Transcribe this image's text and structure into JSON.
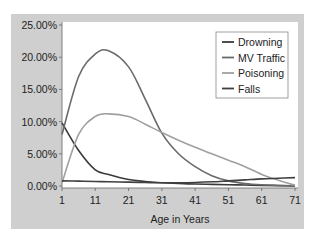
{
  "chart_data": {
    "type": "line",
    "title": "",
    "xlabel": "Age in Years",
    "ylabel": "",
    "x_ticks": [
      "1",
      "11",
      "21",
      "31",
      "41",
      "51",
      "61",
      "71"
    ],
    "y_ticks": [
      "0.00%",
      "5.00%",
      "10.00%",
      "15.00%",
      "20.00%",
      "25.00%"
    ],
    "xlim": [
      1,
      71
    ],
    "ylim": [
      0,
      25
    ],
    "grid": false,
    "legend_position": "upper right",
    "x": [
      1,
      6,
      11,
      15,
      21,
      26,
      31,
      36,
      41,
      46,
      51,
      56,
      61,
      66,
      71
    ],
    "series": [
      {
        "name": "Drowning",
        "color": "#3a3a3a",
        "values": [
          9.8,
          5.5,
          2.5,
          1.8,
          1.0,
          0.7,
          0.5,
          0.4,
          0.3,
          0.25,
          0.2,
          0.15,
          0.1,
          0.05,
          0.0
        ]
      },
      {
        "name": "MV Traffic",
        "color": "#6a6a6a",
        "values": [
          8.0,
          17.0,
          20.5,
          21.0,
          18.5,
          13.5,
          8.2,
          5.0,
          3.0,
          1.6,
          0.8,
          0.4,
          0.2,
          0.1,
          0.0
        ]
      },
      {
        "name": "Poisoning",
        "color": "#a0a0a0",
        "values": [
          0.5,
          8.0,
          10.8,
          11.2,
          10.8,
          9.6,
          8.3,
          7.1,
          6.0,
          5.0,
          4.0,
          3.0,
          1.8,
          0.9,
          0.1
        ]
      },
      {
        "name": "Falls",
        "color": "#404040",
        "values": [
          0.8,
          0.75,
          0.7,
          0.65,
          0.6,
          0.55,
          0.5,
          0.5,
          0.55,
          0.65,
          0.8,
          0.95,
          1.1,
          1.2,
          1.3
        ]
      }
    ]
  },
  "legend": {
    "items": [
      {
        "label": "Drowning",
        "color": "#3a3a3a"
      },
      {
        "label": "MV Traffic",
        "color": "#6a6a6a"
      },
      {
        "label": "Poisoning",
        "color": "#a0a0a0"
      },
      {
        "label": "Falls",
        "color": "#404040"
      }
    ]
  },
  "colors": {
    "panel_bg": "#cfcfcf",
    "plot_bg": "#ffffff",
    "axis": "#555555"
  }
}
